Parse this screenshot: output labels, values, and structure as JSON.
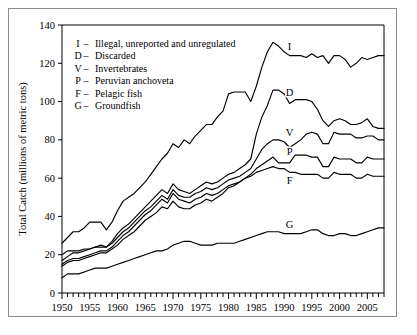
{
  "chart_data": {
    "type": "line",
    "title": "",
    "xlabel": "",
    "ylabel": "Total Catch (millions of metric tons)",
    "xlim": [
      1950,
      2008
    ],
    "ylim": [
      0,
      140
    ],
    "yticks": [
      0,
      20,
      40,
      60,
      80,
      100,
      120,
      140
    ],
    "xticks_labeled": [
      1950,
      1955,
      1960,
      1965,
      1970,
      1975,
      1980,
      1985,
      1990,
      1995,
      2000,
      2005
    ],
    "xtick_interval_minor": 1,
    "grid": false,
    "legend_position": "upper-left-inside",
    "legend_entries": [
      {
        "key": "I",
        "label": "Illegal, unreported and unregulated"
      },
      {
        "key": "D",
        "label": "Discarded"
      },
      {
        "key": "V",
        "label": "Invertebrates"
      },
      {
        "key": "P",
        "label": "Peruvian anchoveta"
      },
      {
        "key": "F",
        "label": "Pelagic fish"
      },
      {
        "key": "G",
        "label": "Groundfish"
      }
    ],
    "annotations": [
      {
        "text": "I",
        "x": 1991,
        "y": 127
      },
      {
        "text": "D",
        "x": 1991,
        "y": 103
      },
      {
        "text": "V",
        "x": 1991,
        "y": 82
      },
      {
        "text": "P",
        "x": 1991,
        "y": 72
      },
      {
        "text": "F",
        "x": 1991,
        "y": 57
      },
      {
        "text": "G",
        "x": 1991,
        "y": 34
      }
    ],
    "x": [
      1950,
      1951,
      1952,
      1953,
      1954,
      1955,
      1956,
      1957,
      1958,
      1959,
      1960,
      1961,
      1962,
      1963,
      1964,
      1965,
      1966,
      1967,
      1968,
      1969,
      1970,
      1971,
      1972,
      1973,
      1974,
      1975,
      1976,
      1977,
      1978,
      1979,
      1980,
      1981,
      1982,
      1983,
      1984,
      1985,
      1986,
      1987,
      1988,
      1989,
      1990,
      1991,
      1992,
      1993,
      1994,
      1995,
      1996,
      1997,
      1998,
      1999,
      2000,
      2001,
      2002,
      2003,
      2004,
      2005,
      2006,
      2007,
      2008
    ],
    "series": [
      {
        "name": "Illegal, unreported and unregulated",
        "key": "I",
        "values": [
          26,
          29,
          32,
          32,
          34,
          37,
          37,
          37,
          33,
          37,
          43,
          48,
          50,
          52,
          55,
          58,
          62,
          66,
          70,
          73,
          78,
          76,
          80,
          78,
          82,
          85,
          88,
          88,
          92,
          95,
          104,
          105,
          105,
          105,
          100,
          108,
          118,
          126,
          131,
          129,
          126,
          124,
          124,
          124,
          123,
          125,
          123,
          124,
          120,
          124,
          124,
          122,
          118,
          120,
          123,
          122,
          123,
          124,
          124
        ]
      },
      {
        "name": "Discarded",
        "key": "D",
        "values": [
          17,
          19,
          21,
          21,
          22,
          23,
          24,
          25,
          24,
          27,
          31,
          34,
          36,
          39,
          42,
          45,
          48,
          51,
          54,
          52,
          57,
          54,
          53,
          52,
          54,
          56,
          58,
          57,
          58,
          60,
          62,
          63,
          65,
          67,
          70,
          83,
          92,
          98,
          106,
          106,
          104,
          99,
          101,
          101,
          101,
          100,
          96,
          90,
          87,
          90,
          91,
          90,
          88,
          88,
          89,
          91,
          87,
          86,
          86
        ]
      },
      {
        "name": "Invertebrates",
        "key": "V",
        "values": [
          20,
          22,
          22,
          22,
          23,
          23,
          24,
          24,
          24,
          26,
          29,
          32,
          34,
          37,
          40,
          43,
          45,
          48,
          51,
          49,
          54,
          51,
          50,
          50,
          52,
          53,
          55,
          54,
          55,
          57,
          59,
          60,
          61,
          63,
          65,
          70,
          75,
          78,
          80,
          80,
          79,
          76,
          78,
          80,
          83,
          84,
          83,
          78,
          78,
          84,
          83,
          83,
          83,
          81,
          81,
          82,
          82,
          80,
          80
        ]
      },
      {
        "name": "Peruvian anchoveta",
        "key": "P",
        "values": [
          15,
          17,
          18,
          18,
          19,
          20,
          21,
          22,
          22,
          24,
          27,
          30,
          32,
          35,
          38,
          41,
          43,
          46,
          49,
          47,
          52,
          49,
          48,
          47,
          49,
          50,
          52,
          51,
          52,
          54,
          56,
          57,
          58,
          60,
          62,
          65,
          67,
          69,
          71,
          68,
          68,
          68,
          72,
          72,
          72,
          71,
          71,
          66,
          66,
          71,
          70,
          70,
          70,
          68,
          68,
          71,
          70,
          70,
          70
        ]
      },
      {
        "name": "Pelagic fish",
        "key": "F",
        "values": [
          14,
          16,
          17,
          17,
          18,
          19,
          20,
          21,
          21,
          23,
          25,
          28,
          30,
          32,
          35,
          38,
          40,
          42,
          45,
          44,
          48,
          45,
          44,
          44,
          46,
          47,
          49,
          48,
          50,
          52,
          55,
          56,
          58,
          60,
          61,
          63,
          64,
          65,
          66,
          65,
          65,
          63,
          63,
          62,
          62,
          62,
          62,
          60,
          60,
          63,
          62,
          62,
          62,
          60,
          60,
          62,
          61,
          61,
          61
        ]
      },
      {
        "name": "Groundfish",
        "key": "G",
        "values": [
          8,
          10,
          10,
          10,
          11,
          12,
          13,
          13,
          13,
          14,
          15,
          16,
          17,
          18,
          19,
          20,
          21,
          22,
          22,
          23,
          25,
          26,
          27,
          27,
          26,
          25,
          25,
          25,
          26,
          26,
          26,
          26,
          27,
          28,
          29,
          30,
          31,
          32,
          32,
          32,
          31,
          31,
          31,
          31,
          32,
          33,
          33,
          31,
          30,
          30,
          31,
          31,
          30,
          30,
          31,
          32,
          33,
          34,
          34
        ]
      }
    ]
  },
  "figure": {
    "yaxis_title": "Total Catch (millions of metric tons)"
  }
}
